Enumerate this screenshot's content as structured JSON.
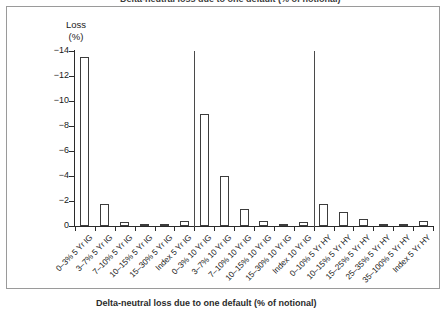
{
  "figure": {
    "top_title_partial": "Delta-neutral loss due to one default (% of notional)",
    "caption": "Delta-neutral loss due to one default (% of notional)"
  },
  "chart_data": {
    "type": "bar",
    "title": "",
    "xlabel": "",
    "ylabel": "Loss (%)",
    "ylabel_line1": "Loss",
    "ylabel_line2": "(%)",
    "ylim": [
      -14,
      0
    ],
    "grid": false,
    "legend": "none",
    "orientation": "vertical",
    "bar_fill": "#ffffff",
    "bar_edge": "#3c3c3c",
    "axis_color": "#2b2b2b",
    "ytick_labels": [
      "-14",
      "-12",
      "-10",
      "-8",
      "-6",
      "-4",
      "-2",
      "0"
    ],
    "ytick_values": [
      -14,
      -12,
      -10,
      -8,
      -6,
      -4,
      -2,
      0
    ],
    "group_dividers_after_index": [
      5,
      11
    ],
    "categories": [
      "0–3% 5 Yr IG",
      "3–7% 5 Yr IG",
      "7–10% 5 Yr IG",
      "10–15% 5 Yr IG",
      "15–30% 5 Yr IG",
      "Index 5 Yr IG",
      "0–3% 10 Yr IG",
      "3–7% 10 Yr IG",
      "7–10% 10 Yr IG",
      "10–15% 10 Yr IG",
      "15–30% 10 Yr IG",
      "Index 10 Yr IG",
      "0–10% 5 Yr HY",
      "10–15% 5 Yr HY",
      "15–25% 5 Yr HY",
      "25–35% 5 Yr HY",
      "35–100% 5 Yr HY",
      "Index 5 Yr HY"
    ],
    "values": [
      -13.5,
      -1.75,
      -0.3,
      -0.15,
      -0.05,
      -0.4,
      -9.0,
      -4.0,
      -1.35,
      -0.4,
      -0.1,
      -0.3,
      -1.75,
      -1.15,
      -0.55,
      -0.15,
      -0.05,
      -0.4
    ],
    "groups": [
      {
        "name": "5 Yr IG",
        "start_index": 0,
        "end_index": 5
      },
      {
        "name": "10 Yr IG",
        "start_index": 6,
        "end_index": 11
      },
      {
        "name": "5 Yr HY",
        "start_index": 12,
        "end_index": 17
      }
    ]
  }
}
